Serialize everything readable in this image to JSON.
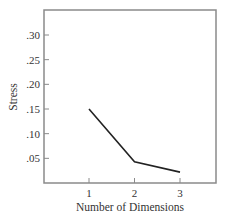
{
  "chart_data": {
    "type": "line",
    "title": "",
    "xlabel": "Number of Dimensions",
    "ylabel": "Stress",
    "x": [
      1,
      2,
      3
    ],
    "categories": [
      "1",
      "2",
      "3"
    ],
    "values": [
      0.15,
      0.043,
      0.022
    ],
    "series": [
      {
        "name": "Stress",
        "values": [
          0.15,
          0.043,
          0.022
        ]
      }
    ],
    "xlim": [
      0.0,
      3.8
    ],
    "ylim": [
      0,
      0.35
    ],
    "x_ticks": [
      "1",
      "2",
      "3"
    ],
    "y_ticks": [
      ".05",
      ".10",
      ".15",
      ".20",
      ".25",
      ".30"
    ],
    "y_tick_values": [
      0.05,
      0.1,
      0.15,
      0.2,
      0.25,
      0.3
    ],
    "grid": false,
    "legend": "none",
    "line_color": "#222222",
    "frame_color": "#888888"
  }
}
